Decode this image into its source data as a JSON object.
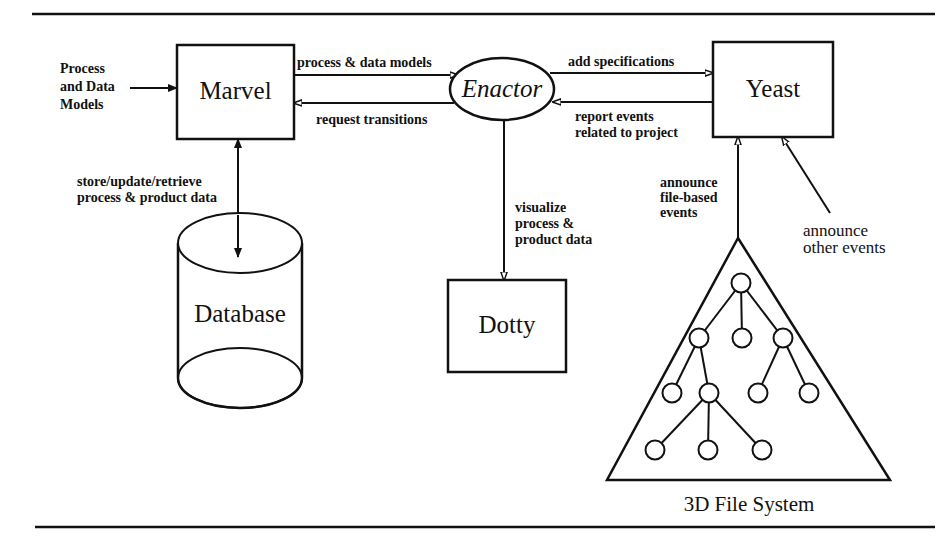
{
  "diagram": {
    "nodes": {
      "marvel": {
        "label": "Marvel"
      },
      "enactor": {
        "label": "Enactor"
      },
      "yeast": {
        "label": "Yeast"
      },
      "database": {
        "label": "Database"
      },
      "dotty": {
        "label": "Dotty"
      },
      "file_system": {
        "label": "3D File System"
      }
    },
    "edges": {
      "input": {
        "lines": [
          "Process",
          "and Data",
          "Models"
        ]
      },
      "marvel_to_enactor": {
        "label": "process & data models"
      },
      "enactor_to_marvel": {
        "label": "request transitions"
      },
      "enactor_to_yeast": {
        "label": "add specifications"
      },
      "yeast_to_enactor": {
        "lines": [
          "report events",
          "related to project"
        ]
      },
      "marvel_database": {
        "lines": [
          "store/update/retrieve",
          "process & product data"
        ]
      },
      "enactor_to_dotty": {
        "lines": [
          "visualize",
          "process &",
          "product data"
        ]
      },
      "fs_to_yeast": {
        "lines": [
          "announce",
          "file-based",
          "events"
        ]
      },
      "other_to_yeast": {
        "lines": [
          "announce",
          "other events"
        ]
      }
    },
    "tree": {
      "circles": [
        {
          "cx": 741,
          "cy": 283
        },
        {
          "cx": 699,
          "cy": 338
        },
        {
          "cx": 742,
          "cy": 338
        },
        {
          "cx": 783,
          "cy": 338
        },
        {
          "cx": 672,
          "cy": 393
        },
        {
          "cx": 709,
          "cy": 393
        },
        {
          "cx": 758,
          "cy": 393
        },
        {
          "cx": 809,
          "cy": 393
        },
        {
          "cx": 655,
          "cy": 450
        },
        {
          "cx": 708,
          "cy": 450
        },
        {
          "cx": 762,
          "cy": 450
        }
      ],
      "links": [
        [
          0,
          1
        ],
        [
          0,
          2
        ],
        [
          0,
          3
        ],
        [
          1,
          4
        ],
        [
          1,
          5
        ],
        [
          3,
          6
        ],
        [
          3,
          7
        ],
        [
          5,
          8
        ],
        [
          5,
          9
        ],
        [
          5,
          10
        ]
      ]
    }
  }
}
